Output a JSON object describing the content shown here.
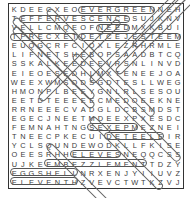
{
  "puzzle": {
    "title": "Word Search",
    "rows": [
      "KDEECXEOEVERGREENNEH",
      "TEFFERVESCENCESUJKNV",
      "VELLCMQEOFNEEDMXKBUI",
      "TPRECXETDETCEJESTEEM",
      "EUQGCRFCIQXLEZRHRMLE",
      "LIFNETSHEBOPSAADBTCQ",
      "SSKALKEEDEEVRSNLINVD",
      "EIEOESEDHLMXTENEEJOA",
      "WEEXWMSODSGDTESLLWEG",
      "HMONPLBEEYGNLRLSESOU",
      "EETDTEEEEECMEDOEEKNE",
      "RRNEEECVADGLDCBSMDST",
      "EGECJNEETMDEEXPXESDC",
      "FEMNAHTNGSEXEPMEZNEI",
      "TNEECPKECUIDETEELEIR",
      "YCLSQUNDEWODKLLFKISE",
      "OEESRHHELEVESNEQQCSS",
      "UJKEEMBEZZLEMENTTDZY",
      "EGGSHELLNRXENJYIIUVZ",
      "ELEVENTHZVEVCTWTKZVJ"
    ],
    "found_words": [
      {
        "word": "EVERGREEN",
        "row": 0,
        "col": 8,
        "len": 9
      },
      {
        "word": "EFFERVESCENCE",
        "row": 1,
        "col": 1,
        "len": 13
      },
      {
        "word": "NEED",
        "row": 2,
        "col": 10,
        "len": 4
      },
      {
        "word": "PRECXET",
        "row": 3,
        "col": 0,
        "len": 8
      },
      {
        "word": "DETCEJES",
        "row": 3,
        "col": 8,
        "len": 12
      },
      {
        "word": "SEXPME",
        "row": 13,
        "col": 9,
        "len": 6
      },
      {
        "word": "DETEEL",
        "row": 14,
        "col": 11,
        "len": 7
      },
      {
        "word": "ELEVES",
        "row": 16,
        "col": 7,
        "len": 6
      },
      {
        "word": "EMBEZZLEMENT",
        "row": 17,
        "col": 4,
        "len": 12
      },
      {
        "word": "EGGSHELL",
        "row": 18,
        "col": 0,
        "len": 8
      },
      {
        "word": "ELEVENTH",
        "row": 19,
        "col": 0,
        "len": 8
      }
    ],
    "text_color": "#3a3a3a",
    "border_color": "#333333"
  }
}
